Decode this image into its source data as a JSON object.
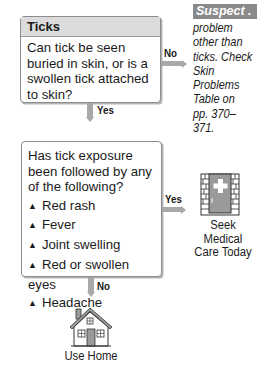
{
  "box1": {
    "title": "Ticks",
    "question": "Can tick be seen buried in skin, or is a swollen tick attached to skin?"
  },
  "box1_no": {
    "label": "No",
    "suspect_title": "Suspect . . .",
    "suspect_text": "problem other than ticks. Check Skin Problems Table on pp. 370–371."
  },
  "box1_yes": {
    "label": "Yes"
  },
  "box2": {
    "question": "Has tick exposure been followed by any of the following?",
    "items": [
      "Red rash",
      "Fever",
      "Joint swelling",
      "Red or swollen eyes",
      "Headache"
    ],
    "bullet": "▲"
  },
  "box2_yes": {
    "label": "Yes",
    "outcome": "Seek Medical Care Today",
    "outcome_line1": "Seek Medical",
    "outcome_line2": "Care Today",
    "icon": "hospital-door-icon"
  },
  "box2_no": {
    "label": "No",
    "outcome": "Use Home",
    "icon": "house-icon"
  },
  "colors": {
    "connector": "#a8a8a8",
    "title_bg": "#dcdcdc",
    "suspect_bg": "#8a8a8a",
    "border": "#8c8c8c"
  }
}
